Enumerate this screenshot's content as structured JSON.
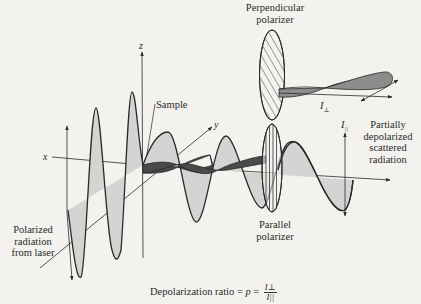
{
  "diagram": {
    "labels": {
      "perpendicular_polarizer": [
        "Perpendicular",
        "polarizer"
      ],
      "parallel_polarizer": [
        "Parallel",
        "polarizer"
      ],
      "sample": "Sample",
      "laser": [
        "Polarized",
        "radiation",
        "from laser"
      ],
      "scattered": [
        "Partially",
        "depolarized",
        "scattered",
        "radiation"
      ],
      "i_perp": "I",
      "i_perp_sub": "⊥",
      "i_par": "I",
      "i_par_sub": "||"
    },
    "axes": {
      "x": "x",
      "y": "y",
      "z": "z"
    },
    "formula": {
      "text": "Depolarization ratio = ",
      "symbol": "p",
      "equals": " = ",
      "numerator": "I⊥",
      "denominator": "I||"
    },
    "colors": {
      "background": "#f3f2ef",
      "stroke": "#2a2a2a",
      "light_fill": "#d4d4d2",
      "dark_fill": "#4a4a4a",
      "mid_fill": "#8c8c8a"
    }
  }
}
